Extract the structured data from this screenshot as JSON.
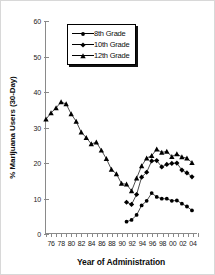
{
  "chart_data": {
    "type": "line",
    "title": "",
    "xlabel": "Year of Administration",
    "ylabel": "% Marijuana Users (30-Day)",
    "xlim": [
      1975,
      2005
    ],
    "ylim": [
      0,
      60
    ],
    "ytick_step": 10,
    "yticks": [
      0,
      10,
      20,
      30,
      40,
      50,
      60
    ],
    "ytick_labels": [
      "0",
      "10",
      "20",
      "30",
      "40",
      "50",
      "60"
    ],
    "xticks": [
      1975,
      1976,
      1977,
      1978,
      1979,
      1980,
      1981,
      1982,
      1983,
      1984,
      1985,
      1986,
      1987,
      1988,
      1989,
      1990,
      1991,
      1992,
      1993,
      1994,
      1995,
      1996,
      1997,
      1998,
      1999,
      2000,
      2001,
      2002,
      2003,
      2004,
      2005
    ],
    "xtick_labels": [
      {
        "x": 1976,
        "label": "76"
      },
      {
        "x": 1978,
        "label": "78"
      },
      {
        "x": 1980,
        "label": "80"
      },
      {
        "x": 1982,
        "label": "82"
      },
      {
        "x": 1984,
        "label": "84"
      },
      {
        "x": 1986,
        "label": "86"
      },
      {
        "x": 1988,
        "label": "88"
      },
      {
        "x": 1990,
        "label": "90"
      },
      {
        "x": 1992,
        "label": "92"
      },
      {
        "x": 1994,
        "label": "94"
      },
      {
        "x": 1996,
        "label": "96"
      },
      {
        "x": 1998,
        "label": "98"
      },
      {
        "x": 2000,
        "label": "00"
      },
      {
        "x": 2002,
        "label": "02"
      },
      {
        "x": 2004,
        "label": "04"
      }
    ],
    "grid": false,
    "legend_position": "top-center",
    "series": [
      {
        "name": "8th Grade",
        "marker": "circle",
        "color": "#000000",
        "x": [
          1991,
          1992,
          1993,
          1994,
          1995,
          1996,
          1997,
          1998,
          1999,
          2000,
          2001,
          2002,
          2003,
          2004
        ],
        "values": [
          3.2,
          3.7,
          5.1,
          7.8,
          9.1,
          11.3,
          10.2,
          9.7,
          9.7,
          9.1,
          9.2,
          8.3,
          7.5,
          6.4
        ]
      },
      {
        "name": "10th Grade",
        "marker": "diamond",
        "color": "#000000",
        "x": [
          1991,
          1992,
          1993,
          1994,
          1995,
          1996,
          1997,
          1998,
          1999,
          2000,
          2001,
          2002,
          2003,
          2004
        ],
        "values": [
          8.7,
          8.1,
          10.9,
          15.8,
          17.2,
          20.4,
          20.5,
          18.7,
          19.4,
          19.7,
          19.8,
          17.8,
          17.0,
          15.9
        ]
      },
      {
        "name": "12th Grade",
        "marker": "triangle",
        "color": "#000000",
        "x": [
          1975,
          1976,
          1977,
          1978,
          1979,
          1980,
          1981,
          1982,
          1983,
          1984,
          1985,
          1986,
          1987,
          1988,
          1989,
          1990,
          1991,
          1992,
          1993,
          1994,
          1995,
          1996,
          1997,
          1998,
          1999,
          2000,
          2001,
          2002,
          2003,
          2004
        ],
        "values": [
          32.2,
          34.0,
          35.4,
          37.1,
          36.5,
          33.7,
          31.6,
          28.5,
          27.0,
          25.2,
          25.7,
          23.4,
          21.0,
          18.0,
          16.7,
          14.0,
          13.8,
          11.9,
          15.5,
          19.0,
          21.2,
          21.9,
          23.7,
          22.8,
          23.1,
          21.6,
          22.4,
          21.5,
          21.2,
          19.9
        ]
      }
    ]
  },
  "legend": {
    "items": [
      {
        "label": "8th Grade",
        "marker": "circle"
      },
      {
        "label": "10th Grade",
        "marker": "diamond"
      },
      {
        "label": "12th Grade",
        "marker": "triangle"
      }
    ]
  }
}
